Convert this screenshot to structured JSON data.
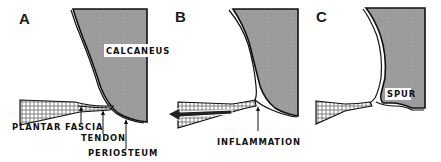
{
  "figure": {
    "colors": {
      "bone": "#9a9a9a",
      "ink": "#111111",
      "background": "#ffffff"
    },
    "panels": [
      {
        "letter": "A",
        "labels": {
          "bone": "CALCANEUS",
          "fascia": "PLANTAR FASCIA",
          "tendon": "TENDON",
          "periosteum": "PERIOSTEUM"
        }
      },
      {
        "letter": "B",
        "labels": {
          "inflammation": "INFLAMMATION"
        },
        "pull_arrow": "left-arrow"
      },
      {
        "letter": "C",
        "labels": {
          "spur": "SPUR"
        }
      }
    ]
  }
}
